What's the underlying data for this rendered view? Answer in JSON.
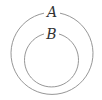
{
  "diagram": {
    "type": "nested-sets",
    "outer_set": {
      "label": "A",
      "stroke": "#8a8a8a"
    },
    "inner_set": {
      "label": "B",
      "stroke": "#8a8a8a"
    },
    "relation": "B is a subset of A"
  }
}
